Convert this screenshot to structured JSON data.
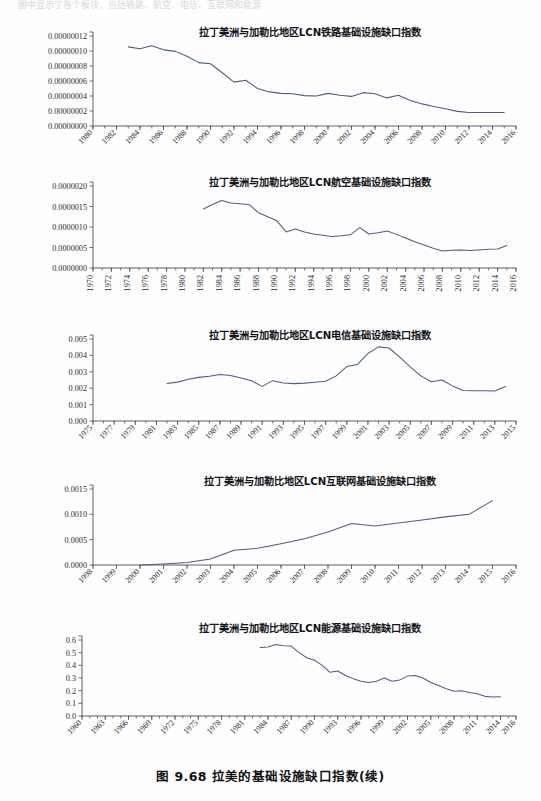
{
  "page": {
    "header_text": "图中显示了各个板块，包括铁路、航空、电信、互联网和能源",
    "caption": "图 9.68    拉美的基础设施缺口指数(续)"
  },
  "chart_data": [
    {
      "id": "rail",
      "type": "line",
      "title": "拉丁美洲与加勒比地区LCN铁路基础设施缺口指数",
      "xlabel": "",
      "ylabel": "",
      "xlim": [
        1980,
        2016
      ],
      "ylim": [
        0,
        1.2e-07
      ],
      "yticks": [
        0,
        2e-08,
        4e-08,
        6e-08,
        8e-08,
        1e-07,
        1.2e-07
      ],
      "ytick_labels": [
        "0.00000000",
        "0.00000002",
        "0.00000004",
        "0.00000006",
        "0.00000008",
        "0.00000010",
        "0.00000012"
      ],
      "xticks": [
        1980,
        1982,
        1984,
        1986,
        1988,
        1990,
        1992,
        1994,
        1996,
        1998,
        2000,
        2002,
        2004,
        2006,
        2008,
        2010,
        2012,
        2014,
        2016
      ],
      "xtick_labels": [
        "1980",
        "1982",
        "1984",
        "1986",
        "1988",
        "1990",
        "1992",
        "1994",
        "1996",
        "1998",
        "2000",
        "2002",
        "2004",
        "2006",
        "2008",
        "2010",
        "2012",
        "2014",
        "2016"
      ],
      "minor_tick_step": 1,
      "xtick_rotated": true,
      "grid": false,
      "legend": "none",
      "x": [
        1983,
        1984,
        1985,
        1986,
        1987,
        1988,
        1989,
        1990,
        1991,
        1992,
        1993,
        1994,
        1995,
        1996,
        1997,
        1998,
        1999,
        2000,
        2001,
        2002,
        2003,
        2004,
        2005,
        2006,
        2007,
        2008,
        2009,
        2010,
        2011,
        2012,
        2013,
        2014,
        2015
      ],
      "values": [
        1.055e-07,
        1.03e-07,
        1.07e-07,
        1.015e-07,
        9.95e-08,
        9.3e-08,
        8.45e-08,
        8.3e-08,
        7.1e-08,
        5.85e-08,
        6.1e-08,
        5e-08,
        4.55e-08,
        4.35e-08,
        4.3e-08,
        4.05e-08,
        4e-08,
        4.35e-08,
        4.1e-08,
        3.95e-08,
        4.45e-08,
        4.3e-08,
        3.75e-08,
        4.1e-08,
        3.4e-08,
        2.95e-08,
        2.6e-08,
        2.3e-08,
        1.95e-08,
        1.8e-08,
        1.8e-08,
        1.8e-08,
        1.8e-08
      ]
    },
    {
      "id": "air",
      "type": "line",
      "title": "拉丁美洲与加勒比地区LCN航空基础设施缺口指数",
      "xlabel": "",
      "ylabel": "",
      "xlim": [
        1970,
        2016
      ],
      "ylim": [
        0,
        2e-06
      ],
      "yticks": [
        0,
        5e-07,
        1e-06,
        1.5e-06,
        2e-06
      ],
      "ytick_labels": [
        "0.0000000",
        "0.0000005",
        "0.0000010",
        "0.0000015",
        "0.0000020"
      ],
      "xticks": [
        1970,
        1972,
        1974,
        1976,
        1978,
        1980,
        1982,
        1984,
        1986,
        1988,
        1990,
        1992,
        1994,
        1996,
        1998,
        2000,
        2002,
        2004,
        2006,
        2008,
        2010,
        2012,
        2014,
        2016
      ],
      "xtick_labels": [
        "1970",
        "1972",
        "1974",
        "1976",
        "1978",
        "1980",
        "1982",
        "1984",
        "1986",
        "1988",
        "1990",
        "1992",
        "1994",
        "1996",
        "1998",
        "2000",
        "2002",
        "2004",
        "2006",
        "2008",
        "2010",
        "2012",
        "2014",
        "2016"
      ],
      "minor_tick_step": 1,
      "xtick_rotated": false,
      "grid": false,
      "legend": "none",
      "x": [
        1982,
        1983,
        1984,
        1985,
        1986,
        1987,
        1988,
        1989,
        1990,
        1991,
        1992,
        1993,
        1994,
        1995,
        1996,
        1997,
        1998,
        1999,
        2000,
        2001,
        2002,
        2003,
        2004,
        2005,
        2006,
        2007,
        2008,
        2009,
        2010,
        2011,
        2012,
        2013,
        2014,
        2015
      ],
      "values": [
        1.44e-06,
        1.55e-06,
        1.645e-06,
        1.585e-06,
        1.565e-06,
        1.545e-06,
        1.35e-06,
        1.25e-06,
        1.15e-06,
        8.8e-07,
        9.5e-07,
        8.8e-07,
        8.3e-07,
        8e-07,
        7.7e-07,
        7.85e-07,
        8.1e-07,
        9.85e-07,
        8.3e-07,
        8.6e-07,
        9e-07,
        8.2e-07,
        7.3e-07,
        6.4e-07,
        5.6e-07,
        4.8e-07,
        4.15e-07,
        4.35e-07,
        4.4e-07,
        4.25e-07,
        4.4e-07,
        4.55e-07,
        4.65e-07,
        5.5e-07
      ]
    },
    {
      "id": "telecom",
      "type": "line",
      "title": "拉丁美洲与加勒比地区LCN电信基础设施缺口指数",
      "xlabel": "",
      "ylabel": "",
      "xlim": [
        1975,
        2015
      ],
      "ylim": [
        0,
        0.005
      ],
      "yticks": [
        0,
        0.001,
        0.002,
        0.003,
        0.004,
        0.005
      ],
      "ytick_labels": [
        "0.000",
        "0.001",
        "0.002",
        "0.003",
        "0.004",
        "0.005"
      ],
      "xticks": [
        1975,
        1977,
        1979,
        1981,
        1983,
        1985,
        1987,
        1989,
        1991,
        1993,
        1995,
        1997,
        1999,
        2001,
        2003,
        2005,
        2007,
        2009,
        2011,
        2013,
        2015
      ],
      "xtick_labels": [
        "1975",
        "1977",
        "1979",
        "1981",
        "1983",
        "1985",
        "1987",
        "1989",
        "1991",
        "1993",
        "1995",
        "1997",
        "1999",
        "2001",
        "2003",
        "2005",
        "2007",
        "2009",
        "2011",
        "2013",
        "2015"
      ],
      "minor_tick_step": 1,
      "xtick_rotated": true,
      "grid": false,
      "legend": "none",
      "x": [
        1982,
        1983,
        1984,
        1985,
        1986,
        1987,
        1988,
        1989,
        1990,
        1991,
        1992,
        1993,
        1994,
        1995,
        1996,
        1997,
        1998,
        1999,
        2000,
        2001,
        2002,
        2003,
        2004,
        2005,
        2006,
        2007,
        2008,
        2009,
        2010,
        2011,
        2012,
        2013,
        2014
      ],
      "values": [
        0.00229,
        0.00237,
        0.00255,
        0.00266,
        0.00273,
        0.00283,
        0.00278,
        0.00262,
        0.00245,
        0.00211,
        0.00246,
        0.00232,
        0.00228,
        0.00231,
        0.00236,
        0.00242,
        0.00275,
        0.00332,
        0.00344,
        0.00412,
        0.00452,
        0.00445,
        0.0039,
        0.0033,
        0.00275,
        0.00239,
        0.0025,
        0.00214,
        0.00186,
        0.00185,
        0.00184,
        0.00183,
        0.00211
      ]
    },
    {
      "id": "internet",
      "type": "line",
      "title": "拉丁美洲与加勒比地区LCN互联网基础设施缺口指数",
      "xlabel": "",
      "ylabel": "",
      "xlim": [
        1998,
        2016
      ],
      "ylim": [
        0,
        0.0015
      ],
      "yticks": [
        0,
        0.0005,
        0.001,
        0.0015
      ],
      "ytick_labels": [
        "0.0000",
        "0.0005",
        "0.0010",
        "0.0015"
      ],
      "xticks": [
        1998,
        1999,
        2000,
        2001,
        2002,
        2003,
        2004,
        2005,
        2006,
        2007,
        2008,
        2009,
        2010,
        2011,
        2012,
        2013,
        2014,
        2015,
        2016
      ],
      "xtick_labels": [
        "1998",
        "1999",
        "2000",
        "2001",
        "2002",
        "2003",
        "2004",
        "2005",
        "2006",
        "2007",
        "2008",
        "2009",
        "2010",
        "2011",
        "2012",
        "2013",
        "2014",
        "2015",
        "2016"
      ],
      "minor_tick_step": 1,
      "xtick_rotated": true,
      "grid": false,
      "legend": "none",
      "x": [
        2000,
        2001,
        2002,
        2003,
        2004,
        2005,
        2006,
        2007,
        2008,
        2009,
        2010,
        2011,
        2012,
        2013,
        2014,
        2015
      ],
      "values": [
        0.0,
        2e-05,
        5e-05,
        0.00012,
        0.00029,
        0.00033,
        0.00042,
        0.00052,
        0.00065,
        0.00082,
        0.00077,
        0.00083,
        0.00089,
        0.00095,
        0.001,
        0.00127
      ]
    },
    {
      "id": "energy",
      "type": "line",
      "title": "拉丁美洲与加勒比地区LCN能源基础设施缺口指数",
      "xlabel": "",
      "ylabel": "",
      "xlim": [
        1960,
        2016
      ],
      "ylim": [
        0,
        0.6
      ],
      "yticks": [
        0,
        0.1,
        0.2,
        0.3,
        0.4,
        0.5,
        0.6
      ],
      "ytick_labels": [
        "0.0",
        "0.1",
        "0.2",
        "0.3",
        "0.4",
        "0.5",
        "0.6"
      ],
      "xticks": [
        1960,
        1963,
        1966,
        1969,
        1972,
        1975,
        1978,
        1981,
        1984,
        1987,
        1990,
        1993,
        1996,
        1999,
        2002,
        2005,
        2008,
        2011,
        2014,
        2016
      ],
      "xtick_labels": [
        "1960",
        "1963",
        "1966",
        "1969",
        "1972",
        "1975",
        "1978",
        "1981",
        "1984",
        "1987",
        "1990",
        "1993",
        "1996",
        "1999",
        "2002",
        "2005",
        "2008",
        "2011",
        "2014",
        "2016"
      ],
      "minor_tick_step": 1,
      "xtick_rotated": true,
      "grid": false,
      "legend": "none",
      "x": [
        1983,
        1984,
        1985,
        1986,
        1987,
        1988,
        1989,
        1990,
        1991,
        1992,
        1993,
        1994,
        1995,
        1996,
        1997,
        1998,
        1999,
        2000,
        2001,
        2002,
        2003,
        2004,
        2005,
        2006,
        2007,
        2008,
        2009,
        2010,
        2011,
        2012,
        2013,
        2014
      ],
      "values": [
        0.54,
        0.545,
        0.565,
        0.555,
        0.552,
        0.5,
        0.46,
        0.44,
        0.4,
        0.345,
        0.355,
        0.32,
        0.295,
        0.275,
        0.265,
        0.275,
        0.3,
        0.275,
        0.285,
        0.315,
        0.32,
        0.3,
        0.265,
        0.24,
        0.215,
        0.195,
        0.2,
        0.185,
        0.175,
        0.155,
        0.15,
        0.152
      ]
    }
  ],
  "colors": {
    "series_line": "#4a5f80",
    "axis": "#4a4a55",
    "text": "#2a2a33",
    "page_background": "#fefefe"
  }
}
